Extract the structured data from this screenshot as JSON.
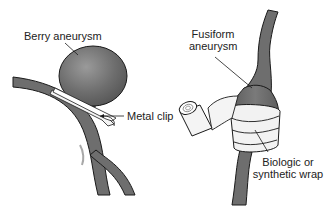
{
  "figure": {
    "panels": [
      {
        "id": "left",
        "subject": "Berry aneurysm clipped with metal clip",
        "labels": [
          {
            "key": "berry",
            "text": "Berry aneurysm"
          },
          {
            "key": "clip",
            "text": "Metal clip"
          }
        ]
      },
      {
        "id": "right",
        "subject": "Fusiform aneurysm wrapped",
        "labels": [
          {
            "key": "fusiform_line1",
            "text": "Fusiform"
          },
          {
            "key": "fusiform_line2",
            "text": "aneurysm"
          },
          {
            "key": "wrap_line1",
            "text": "Biologic or"
          },
          {
            "key": "wrap_line2",
            "text": "synthetic wrap"
          }
        ]
      }
    ],
    "colors": {
      "vessel": "#6e6e6e",
      "vessel_dark": "#5a5a5a",
      "outline": "#1a1a1a",
      "wrap": "#f2f2f2",
      "background": "#ffffff"
    }
  }
}
